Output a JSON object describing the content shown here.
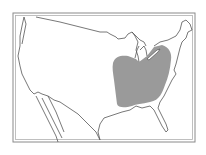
{
  "map": {
    "type": "range-map",
    "region_depicted": "contiguous United States",
    "colors": {
      "background": "#ffffff",
      "frame": "#8a8a8a",
      "outline": "#555555",
      "range_fill": "#9a9a9a"
    },
    "range": {
      "description": "shaded range over east-central United States (Ohio Valley / Midwest region)"
    }
  }
}
